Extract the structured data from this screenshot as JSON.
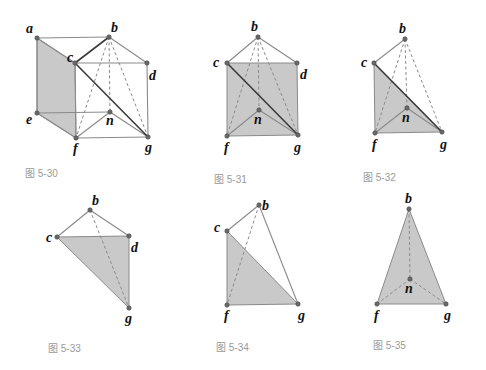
{
  "colors": {
    "face_fill": "#c9c9c9",
    "edge": "#8a8a8a",
    "edge_dark": "#3a3a3a",
    "vertex": "#6a6a6a",
    "label": "#111111",
    "caption": "#9a9a9a"
  },
  "figures": [
    {
      "id": "fig-5-30",
      "caption": "图 5-30",
      "caption_pos": [
        25,
        177
      ],
      "points": {
        "a": {
          "xy": [
            37,
            38
          ],
          "label_xy": [
            26,
            33
          ]
        },
        "b": {
          "xy": [
            109,
            37
          ],
          "label_xy": [
            111,
            32
          ]
        },
        "c": {
          "xy": [
            75,
            63
          ],
          "label_xy": [
            67,
            62
          ]
        },
        "d": {
          "xy": [
            147,
            63
          ],
          "label_xy": [
            149,
            80
          ]
        },
        "e": {
          "xy": [
            37,
            113
          ],
          "label_xy": [
            26,
            124
          ]
        },
        "n": {
          "xy": [
            110,
            112
          ],
          "label_xy": [
            106,
            125
          ]
        },
        "f": {
          "xy": [
            76,
            138
          ],
          "label_xy": [
            73,
            153
          ]
        },
        "g": {
          "xy": [
            148,
            137
          ],
          "label_xy": [
            145,
            152
          ]
        }
      },
      "faces": [
        [
          "a",
          "c",
          "f",
          "e"
        ]
      ],
      "edges": [
        [
          "a",
          "b"
        ],
        [
          "a",
          "e"
        ],
        [
          "e",
          "n"
        ],
        [
          "e",
          "f"
        ],
        [
          "a",
          "c"
        ],
        [
          "c",
          "d"
        ],
        [
          "b",
          "d"
        ],
        [
          "d",
          "g"
        ],
        [
          "c",
          "f"
        ],
        [
          "f",
          "g"
        ],
        [
          "f",
          "n"
        ],
        [
          "n",
          "g"
        ]
      ],
      "dark_edges": [
        [
          "c",
          "b"
        ],
        [
          "c",
          "g"
        ],
        [
          "b",
          "f"
        ]
      ],
      "dashed_edges": [
        [
          "b",
          "n"
        ],
        [
          "b",
          "g"
        ]
      ],
      "hidden_dashed": [
        [
          "b",
          "f"
        ]
      ]
    },
    {
      "id": "fig-5-31",
      "caption": "图 5-31",
      "caption_pos": [
        214,
        183
      ],
      "points": {
        "b": {
          "xy": [
            258,
            37
          ],
          "label_xy": [
            251,
            31
          ]
        },
        "c": {
          "xy": [
            227,
            63
          ],
          "label_xy": [
            213,
            67
          ]
        },
        "d": {
          "xy": [
            297,
            63
          ],
          "label_xy": [
            300,
            79
          ]
        },
        "n": {
          "xy": [
            259,
            110
          ],
          "label_xy": [
            254,
            124
          ]
        },
        "f": {
          "xy": [
            227,
            136
          ],
          "label_xy": [
            224,
            152
          ]
        },
        "g": {
          "xy": [
            298,
            135
          ],
          "label_xy": [
            294,
            152
          ]
        }
      },
      "faces": [
        [
          "c",
          "d",
          "g",
          "f"
        ]
      ],
      "edges": [
        [
          "b",
          "c"
        ],
        [
          "b",
          "d"
        ],
        [
          "f",
          "n"
        ],
        [
          "n",
          "g"
        ]
      ],
      "dark_edges": [
        [
          "c",
          "g"
        ]
      ],
      "dashed_edges": [
        [
          "b",
          "f"
        ],
        [
          "b",
          "n"
        ],
        [
          "b",
          "g"
        ]
      ]
    },
    {
      "id": "fig-5-32",
      "caption": "图 5-32",
      "caption_pos": [
        363,
        181
      ],
      "points": {
        "b": {
          "xy": [
            405,
            39
          ],
          "label_xy": [
            399,
            33
          ]
        },
        "c": {
          "xy": [
            374,
            63
          ],
          "label_xy": [
            361,
            67
          ]
        },
        "n": {
          "xy": [
            407,
            108
          ],
          "label_xy": [
            402,
            122
          ]
        },
        "f": {
          "xy": [
            375,
            133
          ],
          "label_xy": [
            372,
            149
          ]
        },
        "g": {
          "xy": [
            442,
            132
          ],
          "label_xy": [
            440,
            149
          ]
        }
      },
      "faces": [
        [
          "c",
          "g",
          "f"
        ]
      ],
      "edges": [
        [
          "b",
          "c"
        ],
        [
          "f",
          "n"
        ],
        [
          "n",
          "g"
        ]
      ],
      "dark_edges": [
        [
          "c",
          "g"
        ]
      ],
      "dashed_edges": [
        [
          "b",
          "f"
        ],
        [
          "b",
          "n"
        ],
        [
          "b",
          "g"
        ]
      ]
    },
    {
      "id": "fig-5-33",
      "caption": "图 5-33",
      "caption_pos": [
        48,
        352
      ],
      "points": {
        "b": {
          "xy": [
            90,
            210
          ],
          "label_xy": [
            92,
            205
          ]
        },
        "c": {
          "xy": [
            57,
            237
          ],
          "label_xy": [
            46,
            242
          ]
        },
        "d": {
          "xy": [
            129,
            236
          ],
          "label_xy": [
            131,
            252
          ]
        },
        "g": {
          "xy": [
            129,
            308
          ],
          "label_xy": [
            125,
            323
          ]
        }
      },
      "faces": [
        [
          "c",
          "d",
          "g"
        ]
      ],
      "edges": [
        [
          "b",
          "c"
        ],
        [
          "b",
          "d"
        ]
      ],
      "dark_edges": [],
      "dashed_edges": [
        [
          "b",
          "g"
        ]
      ]
    },
    {
      "id": "fig-5-34",
      "caption": "图 5-34",
      "caption_pos": [
        216,
        351
      ],
      "points": {
        "b": {
          "xy": [
            259,
            205
          ],
          "label_xy": [
            262,
            210
          ]
        },
        "c": {
          "xy": [
            227,
            231
          ],
          "label_xy": [
            214,
            232
          ]
        },
        "f": {
          "xy": [
            227,
            305
          ],
          "label_xy": [
            224,
            320
          ]
        },
        "g": {
          "xy": [
            298,
            304
          ],
          "label_xy": [
            298,
            320
          ]
        }
      },
      "faces": [
        [
          "c",
          "g",
          "f"
        ]
      ],
      "edges": [
        [
          "b",
          "c"
        ],
        [
          "b",
          "g"
        ]
      ],
      "dark_edges": [],
      "dashed_edges": [
        [
          "b",
          "f"
        ]
      ]
    },
    {
      "id": "fig-5-35",
      "caption": "图 5-35",
      "caption_pos": [
        373,
        349
      ],
      "points": {
        "b": {
          "xy": [
            409,
            209
          ],
          "label_xy": [
            405,
            203
          ]
        },
        "n": {
          "xy": [
            410,
            279
          ],
          "label_xy": [
            405,
            293
          ]
        },
        "f": {
          "xy": [
            377,
            304
          ],
          "label_xy": [
            374,
            320
          ]
        },
        "g": {
          "xy": [
            446,
            304
          ],
          "label_xy": [
            444,
            320
          ]
        }
      },
      "faces": [
        [
          "b",
          "g",
          "f"
        ]
      ],
      "edges": [],
      "dark_edges": [],
      "dashed_edges": [
        [
          "b",
          "n"
        ],
        [
          "f",
          "n"
        ],
        [
          "n",
          "g"
        ]
      ]
    }
  ]
}
